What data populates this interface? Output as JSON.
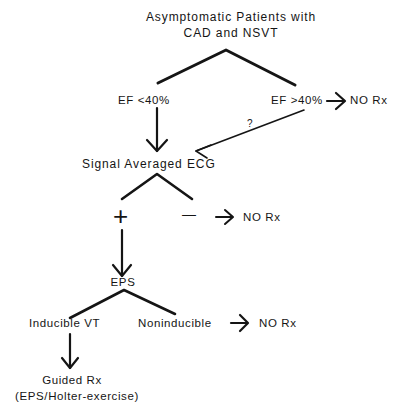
{
  "root": {
    "line1": "Asymptomatic  Patients  with",
    "line2": "CAD and NSVT"
  },
  "branch1": {
    "left": "EF <40%",
    "right": "EF >40%",
    "right_outcome": "NO Rx",
    "question_mark": "?"
  },
  "saecg": {
    "label": "Signal  Averaged  ECG",
    "positive_symbol": "+",
    "negative_symbol": "—",
    "negative_outcome": "NO Rx"
  },
  "eps": {
    "label": "EPS",
    "left": "Inducible  VT",
    "right": "Noninducible",
    "right_outcome": "NO Rx"
  },
  "final": {
    "line1": "Guided Rx",
    "line2": "(EPS/Holter-exercise)"
  },
  "colors": {
    "ink": "#151515",
    "background": "#ffffff"
  }
}
